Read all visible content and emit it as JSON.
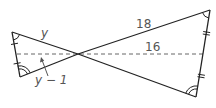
{
  "diagram": {
    "type": "geometry",
    "labels": {
      "left_top_side": "y",
      "left_segment": "y − 1",
      "right_top_side": "18",
      "right_segment": "16"
    },
    "colors": {
      "stroke": "#222222",
      "dashed": "#666666",
      "label": "#555555"
    }
  }
}
